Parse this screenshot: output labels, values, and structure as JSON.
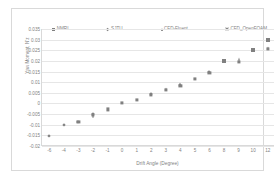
{
  "chart_data": {
    "type": "scatter",
    "title": "",
    "xlabel": "Drift Angle (Degree)",
    "ylabel": "Yaw Moment, N'z",
    "grid": true,
    "legend_position": "top",
    "x_categories": [
      "-6",
      "-4",
      "-3",
      "-2",
      "-1",
      "0",
      "1",
      "2",
      "3",
      "4",
      "5",
      "6",
      "8",
      "9",
      "10",
      "12"
    ],
    "y_ticks": [
      "0.035",
      "0.03",
      "0.025",
      "0.02",
      "0.015",
      "0.01",
      "0.005",
      "0",
      "-0.005",
      "-0.01",
      "-0.015",
      "-0.02"
    ],
    "ylim": [
      -0.02,
      0.035
    ],
    "series": [
      {
        "name": "NMRI",
        "marker": "square",
        "color": "#808080",
        "points": [
          {
            "x": "-3",
            "y": -0.0088
          },
          {
            "x": "-2",
            "y": -0.0055
          },
          {
            "x": "-1",
            "y": -0.0028
          },
          {
            "x": "0",
            "y": 0.0002
          },
          {
            "x": "1",
            "y": 0.0017
          },
          {
            "x": "2",
            "y": 0.0042
          },
          {
            "x": "3",
            "y": 0.0063
          },
          {
            "x": "4",
            "y": 0.0082
          },
          {
            "x": "5",
            "y": 0.0115
          },
          {
            "x": "6",
            "y": 0.0143
          },
          {
            "x": "9",
            "y": 0.0196
          },
          {
            "x": "12",
            "y": 0.0258
          }
        ]
      },
      {
        "name": "SJTU",
        "marker": "diamond",
        "color": "#808080",
        "points": [
          {
            "x": "-6",
            "y": -0.0152
          },
          {
            "x": "-4",
            "y": -0.0103
          },
          {
            "x": "-3",
            "y": -0.0088
          },
          {
            "x": "-2",
            "y": -0.005
          },
          {
            "x": "2",
            "y": 0.0044
          },
          {
            "x": "4",
            "y": 0.0088
          },
          {
            "x": "6",
            "y": 0.0148
          }
        ]
      },
      {
        "name": "CFD-Fluent",
        "marker": "triangle",
        "color": "#808080",
        "points": [
          {
            "x": "-2",
            "y": -0.006
          },
          {
            "x": "2",
            "y": 0.0045
          },
          {
            "x": "3",
            "y": 0.0066
          },
          {
            "x": "4",
            "y": 0.009
          },
          {
            "x": "6",
            "y": 0.015
          },
          {
            "x": "9",
            "y": 0.0208
          },
          {
            "x": "12",
            "y": 0.0262
          }
        ]
      },
      {
        "name": "CFD_OpenFOAM",
        "marker": "cross",
        "color": "#808080",
        "points": [
          {
            "x": "8",
            "y": 0.02
          },
          {
            "x": "10",
            "y": 0.0252
          },
          {
            "x": "12",
            "y": 0.0298
          }
        ]
      }
    ]
  },
  "legend": {
    "items": [
      {
        "label": "NMRI",
        "marker": "square"
      },
      {
        "label": "SJTU",
        "marker": "diamond"
      },
      {
        "label": "CFD-Fluent",
        "marker": "triangle"
      },
      {
        "label": "CFD_OpenFOAM",
        "marker": "cross"
      }
    ]
  }
}
